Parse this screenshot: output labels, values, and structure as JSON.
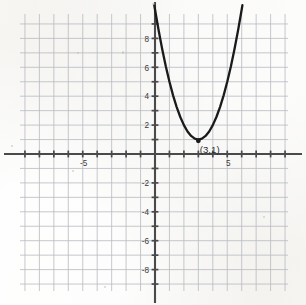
{
  "image": {
    "kind": "scanned-graph-paper",
    "background_color": "#f3f2ef",
    "grid_color": "#b9bcc2",
    "axis_color": "#4a4a4c",
    "curve_color": "#1a1a1a",
    "label_color": "#3a3a3c"
  },
  "chart_data": {
    "type": "line",
    "title": "",
    "xlabel": "",
    "ylabel": "",
    "xlim": [
      -9.4,
      9.2
    ],
    "ylim": [
      -9.7,
      9.6
    ],
    "grid": true,
    "grid_step": 1,
    "legend": "none",
    "axes": {
      "x_tick_labels": [
        {
          "value": -5,
          "text": "-5"
        },
        {
          "value": 5,
          "text": "5"
        }
      ],
      "y_tick_labels": [
        {
          "value": 8,
          "text": "8"
        },
        {
          "value": 6,
          "text": "6"
        },
        {
          "value": 4,
          "text": "4"
        },
        {
          "value": 2,
          "text": "2"
        },
        {
          "value": -2,
          "text": "-2"
        },
        {
          "value": -4,
          "text": "-4"
        },
        {
          "value": -6,
          "text": "-6"
        },
        {
          "value": -8,
          "text": "-8"
        }
      ],
      "minor_tick_values_x": [
        -9,
        -8,
        -7,
        -6,
        -5,
        -4,
        -3,
        -2,
        -1,
        1,
        2,
        3,
        4,
        5,
        6,
        7,
        8,
        9
      ],
      "minor_tick_values_y": [
        -9,
        -8,
        -7,
        -6,
        -5,
        -4,
        -3,
        -2,
        -1,
        1,
        2,
        3,
        4,
        5,
        6,
        7,
        8,
        9
      ]
    },
    "series": [
      {
        "name": "parabola",
        "equation": "y = (x - 3)^2 + 1",
        "vertex": [
          3,
          1
        ],
        "a": 1,
        "points": [
          [
            -0.05,
            10.3
          ],
          [
            0.0,
            10.0
          ],
          [
            0.25,
            8.56
          ],
          [
            0.5,
            7.25
          ],
          [
            0.75,
            6.06
          ],
          [
            1.0,
            5.0
          ],
          [
            1.25,
            4.06
          ],
          [
            1.5,
            3.25
          ],
          [
            1.75,
            2.56
          ],
          [
            2.0,
            2.0
          ],
          [
            2.25,
            1.56
          ],
          [
            2.5,
            1.25
          ],
          [
            2.75,
            1.06
          ],
          [
            3.0,
            1.0
          ],
          [
            3.25,
            1.06
          ],
          [
            3.5,
            1.25
          ],
          [
            3.75,
            1.56
          ],
          [
            4.0,
            2.0
          ],
          [
            4.25,
            2.56
          ],
          [
            4.5,
            3.25
          ],
          [
            4.75,
            4.06
          ],
          [
            5.0,
            5.0
          ],
          [
            5.25,
            6.06
          ],
          [
            5.5,
            7.25
          ],
          [
            5.75,
            8.56
          ],
          [
            6.0,
            10.0
          ],
          [
            6.05,
            10.3
          ]
        ]
      }
    ],
    "annotations": [
      {
        "name": "vertex-label",
        "text": "(3,1)",
        "at": [
          3,
          1
        ],
        "marker": "dot"
      }
    ]
  }
}
